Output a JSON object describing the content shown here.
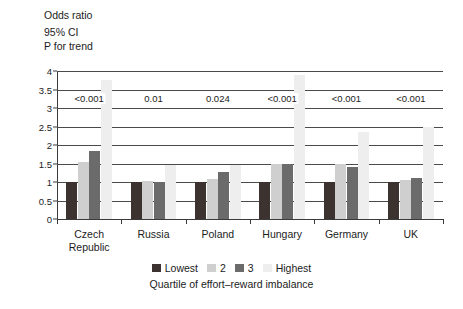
{
  "caption": {
    "line1": "Odds ratio",
    "line2": "95% CI",
    "line3": "P for trend"
  },
  "chart_data": {
    "type": "bar",
    "title": "Odds ratio",
    "subtitle": "95% CI / P for trend",
    "xlabel": "Quartile of effort–reward imbalance",
    "ylabel": "Odds ratio",
    "ylim": [
      0,
      4
    ],
    "yticks": [
      "0",
      "0.5",
      "1",
      "1.5",
      "2",
      "2.5",
      "3",
      "3.5",
      "4"
    ],
    "ytick_values": [
      0,
      0.5,
      1,
      1.5,
      2,
      2.5,
      3,
      3.5,
      4
    ],
    "grid": true,
    "legend_position": "bottom",
    "categories": [
      "Czech\nRepublic",
      "Russia",
      "Poland",
      "Hungary",
      "Germany",
      "UK"
    ],
    "series": [
      {
        "name": "Lowest",
        "color": "#3c3330",
        "values": [
          1.0,
          1.0,
          1.0,
          1.0,
          1.0,
          1.0
        ]
      },
      {
        "name": "2",
        "color": "#cfcfcf",
        "values": [
          1.55,
          1.02,
          1.07,
          1.5,
          1.5,
          1.05
        ]
      },
      {
        "name": "3",
        "color": "#6b6b6b",
        "values": [
          1.85,
          1.0,
          1.28,
          1.5,
          1.4,
          1.1
        ]
      },
      {
        "name": "Highest",
        "color": "#eeeeee",
        "values": [
          3.75,
          1.45,
          1.45,
          3.9,
          2.35,
          2.5
        ]
      }
    ],
    "annotations": [
      {
        "category": "Czech\nRepublic",
        "label": "<0.001"
      },
      {
        "category": "Russia",
        "label": "0.01"
      },
      {
        "category": "Poland",
        "label": "0.024"
      },
      {
        "category": "Hungary",
        "label": "<0.001"
      },
      {
        "category": "Germany",
        "label": "<0.001"
      },
      {
        "category": "UK",
        "label": "<0.001"
      }
    ],
    "annotation_y": 3.25
  },
  "legend": {
    "items": [
      {
        "label": "Lowest",
        "color": "#3c3330"
      },
      {
        "label": "2",
        "color": "#cfcfcf"
      },
      {
        "label": "3",
        "color": "#6b6b6b"
      },
      {
        "label": "Highest",
        "color": "#eeeeee"
      }
    ]
  }
}
